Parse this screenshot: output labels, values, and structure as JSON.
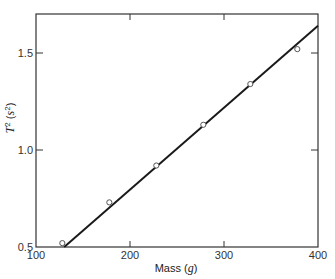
{
  "chart_data": {
    "type": "scatter",
    "title": "",
    "xlabel": "Mass (g)",
    "xlabel_parts": {
      "text": "Mass (",
      "var": "g",
      "close": ")"
    },
    "ylabel": "T^2 (s^2)",
    "ylabel_parts": {
      "var": "T",
      "sup": "2",
      "open": " (",
      "unit": "s",
      "unit_sup": "2",
      "close": ")"
    },
    "xlim": [
      100,
      400
    ],
    "ylim": [
      0.5,
      1.7
    ],
    "xticks": [
      100,
      200,
      300,
      400
    ],
    "xtick_labels": [
      "100",
      "200",
      "300",
      "400"
    ],
    "yticks": [
      0.5,
      1.0,
      1.5
    ],
    "ytick_labels": [
      "0.5",
      "1.0",
      "1.5"
    ],
    "grid": false,
    "legend": "none",
    "series": [
      {
        "name": "measurements",
        "marker": "open-circle",
        "x": [
          128,
          178,
          228,
          278,
          328,
          378
        ],
        "y": [
          0.52,
          0.73,
          0.92,
          1.13,
          1.34,
          1.52
        ]
      }
    ],
    "fit_line": {
      "name": "linear fit",
      "x": [
        130,
        400
      ],
      "y": [
        0.5,
        1.64
      ]
    },
    "colors": {
      "axis": "#333333",
      "line": "#1a1a1a",
      "marker": "#555555"
    }
  }
}
